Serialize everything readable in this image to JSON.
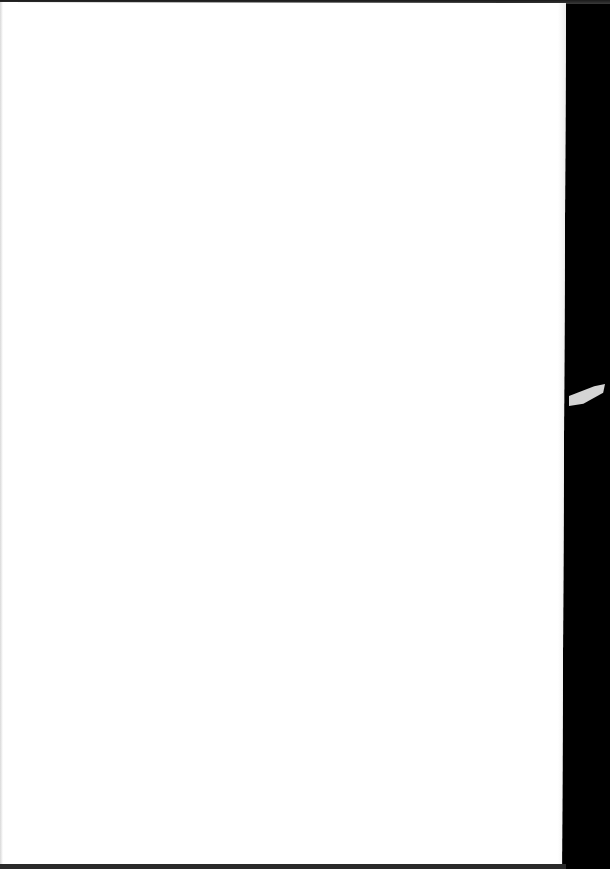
{
  "document": {
    "page": {
      "content": "",
      "background_color": "#ffffff"
    },
    "scan_border_color": "#000000",
    "artifacts": [
      {
        "type": "paper-fragment",
        "color": "#d4d4d4"
      }
    ]
  }
}
